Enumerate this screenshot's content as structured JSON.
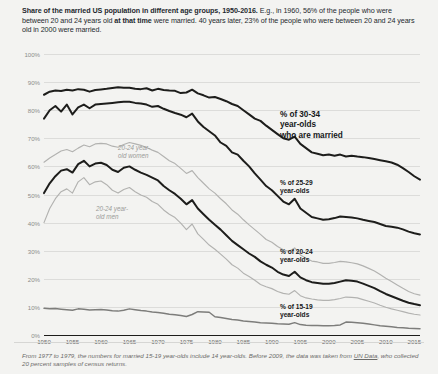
{
  "header": {
    "title_bold": "Share of the married US population in different age groups, 1950-2016.",
    "title_rest_1": " E.g., in 1960, 56% of the people who were between 20 and 24 years old ",
    "title_bold_2": "at that time",
    "title_rest_2": " were married. 40 years later, 23% of the people who were between 20 and 24 years old in 2000 were married."
  },
  "footnote": {
    "part1": "From 1977 to 1979, the numbers for married 15-19 year-olds include 14 year-olds. Before 2009, the data was taken from ",
    "link": "UN Data",
    "part2": ", who collected 20 percent samples of census returns."
  },
  "annotations": {
    "a30_34": "% of 30-34\nyear-olds\nwho are married",
    "a25_29": "% of 25-29\nyear-olds",
    "a20_24": "% of 20-24\nyear-olds",
    "a15_19": "% of 15-19\nyear-olds",
    "women": "20-24 year-\nold women",
    "men": "20-24 year-\nold men"
  },
  "colors": {
    "dark_line": "#1d1d1b",
    "grey_line": "#b2b2b0",
    "mid_line": "#7d7d7b",
    "grid": "#dcdcda",
    "background": "#f3f3f1"
  },
  "chart_data": {
    "type": "line",
    "title": "Share of the married US population in different age groups, 1950-2016",
    "xlabel": "",
    "ylabel": "",
    "xlim": [
      1950,
      2016
    ],
    "ylim": [
      0,
      100
    ],
    "grid": true,
    "legend": "inline-annotations",
    "yticks": [
      "0%",
      "10%",
      "20%",
      "30%",
      "40%",
      "50%",
      "60%",
      "70%",
      "80%",
      "90%",
      "100%"
    ],
    "ytick_values": [
      0,
      10,
      20,
      30,
      40,
      50,
      60,
      70,
      80,
      90,
      100
    ],
    "xticks": [
      "1950",
      "1955",
      "1960",
      "1965",
      "1970",
      "1975",
      "1980",
      "1985",
      "1990",
      "1995",
      "2000",
      "2005",
      "2010",
      "2015"
    ],
    "xtick_values": [
      1950,
      1955,
      1960,
      1965,
      1970,
      1975,
      1980,
      1985,
      1990,
      1995,
      2000,
      2005,
      2010,
      2015
    ],
    "x": [
      1950,
      1951,
      1952,
      1953,
      1954,
      1955,
      1956,
      1957,
      1958,
      1959,
      1960,
      1961,
      1962,
      1963,
      1964,
      1965,
      1966,
      1967,
      1968,
      1969,
      1970,
      1971,
      1972,
      1973,
      1974,
      1975,
      1976,
      1977,
      1978,
      1979,
      1980,
      1981,
      1982,
      1983,
      1984,
      1985,
      1986,
      1987,
      1988,
      1989,
      1990,
      1991,
      1992,
      1993,
      1994,
      1995,
      1996,
      1997,
      1998,
      1999,
      2000,
      2001,
      2002,
      2003,
      2004,
      2005,
      2006,
      2007,
      2008,
      2009,
      2010,
      2011,
      2012,
      2013,
      2014,
      2015,
      2016
    ],
    "series": [
      {
        "name": "% of 30-34 year-olds who are married",
        "color": "#1d1d1b",
        "width": "thick",
        "values": [
          85.5,
          86.6,
          87.0,
          86.8,
          87.3,
          87.0,
          87.5,
          87.3,
          86.6,
          87.2,
          87.4,
          87.6,
          87.9,
          88.2,
          88.0,
          88.0,
          87.6,
          87.5,
          87.8,
          87.0,
          87.6,
          87.2,
          87.0,
          86.9,
          86.1,
          86.3,
          87.3,
          86.0,
          85.3,
          84.5,
          84.7,
          84.0,
          83.2,
          82.2,
          81.5,
          80.0,
          78.5,
          77.0,
          76.2,
          74.5,
          73.0,
          71.5,
          70.0,
          69.5,
          70.6,
          68.0,
          66.5,
          65.0,
          64.5,
          64.0,
          64.2,
          63.8,
          64.2,
          63.5,
          63.8,
          63.5,
          63.3,
          63.0,
          62.6,
          62.2,
          61.8,
          61.4,
          60.6,
          59.4,
          58.0,
          56.5,
          55.3
        ]
      },
      {
        "name": "% of 25-29 year-olds",
        "color": "#1d1d1b",
        "width": "thick",
        "values": [
          77.0,
          80.0,
          81.5,
          79.5,
          82.0,
          78.5,
          81.0,
          82.0,
          80.7,
          82.0,
          82.2,
          82.4,
          82.6,
          82.8,
          83.0,
          83.0,
          82.6,
          82.4,
          82.0,
          81.2,
          81.5,
          80.5,
          79.7,
          79.0,
          78.4,
          77.5,
          78.8,
          76.0,
          74.0,
          72.5,
          71.0,
          68.5,
          67.3,
          65.0,
          64.2,
          62.0,
          60.0,
          57.5,
          55.3,
          53.0,
          51.5,
          49.5,
          47.5,
          46.5,
          48.5,
          45.0,
          43.5,
          42.0,
          41.5,
          41.0,
          41.2,
          41.6,
          42.2,
          42.0,
          41.8,
          41.5,
          41.0,
          40.6,
          40.2,
          39.5,
          38.8,
          38.5,
          38.2,
          37.6,
          36.8,
          36.2,
          35.8
        ]
      },
      {
        "name": "20-24 year-old women",
        "color": "#b2b2b0",
        "width": "thin",
        "values": [
          61.5,
          63.0,
          64.2,
          65.5,
          66.0,
          65.2,
          66.5,
          67.6,
          67.0,
          68.0,
          68.2,
          68.0,
          67.2,
          66.8,
          67.8,
          68.5,
          68.0,
          67.5,
          66.7,
          65.8,
          65.0,
          63.5,
          62.0,
          61.0,
          59.3,
          57.5,
          58.5,
          56.0,
          54.0,
          52.0,
          50.5,
          48.5,
          46.7,
          44.5,
          43.0,
          41.0,
          39.2,
          37.5,
          35.8,
          34.0,
          33.0,
          31.5,
          30.3,
          29.8,
          31.0,
          28.5,
          27.3,
          26.3,
          26.0,
          25.5,
          25.5,
          25.8,
          26.2,
          26.0,
          25.7,
          25.3,
          24.6,
          23.7,
          22.8,
          21.5,
          20.2,
          19.0,
          17.8,
          16.6,
          15.5,
          14.7,
          14.2
        ]
      },
      {
        "name": "20-24 year-olds",
        "color": "#1d1d1b",
        "width": "thick",
        "values": [
          50.5,
          54.0,
          56.5,
          58.5,
          59.0,
          57.8,
          60.8,
          62.0,
          60.0,
          61.0,
          61.3,
          60.5,
          58.8,
          58.0,
          59.5,
          60.0,
          58.8,
          57.8,
          57.0,
          56.0,
          55.0,
          53.0,
          51.5,
          50.2,
          48.5,
          46.5,
          48.0,
          45.0,
          43.0,
          41.0,
          39.2,
          37.5,
          35.5,
          33.5,
          32.0,
          30.5,
          29.0,
          27.8,
          26.2,
          25.0,
          24.0,
          22.5,
          21.5,
          21.0,
          22.5,
          20.5,
          19.5,
          18.8,
          18.5,
          18.2,
          18.2,
          18.5,
          19.0,
          19.5,
          19.3,
          19.0,
          18.3,
          17.5,
          16.7,
          15.6,
          14.6,
          13.8,
          13.0,
          12.2,
          11.5,
          11.0,
          10.6
        ]
      },
      {
        "name": "20-24 year-old men",
        "color": "#b2b2b0",
        "width": "thin",
        "values": [
          40.0,
          45.0,
          48.5,
          51.0,
          52.0,
          50.5,
          54.5,
          56.0,
          53.5,
          54.5,
          54.8,
          53.5,
          51.5,
          50.5,
          51.8,
          52.5,
          51.0,
          49.8,
          49.0,
          47.5,
          46.5,
          44.5,
          43.0,
          41.8,
          39.8,
          37.5,
          39.5,
          36.0,
          34.0,
          32.0,
          30.5,
          28.8,
          27.0,
          25.0,
          23.8,
          22.0,
          20.8,
          19.5,
          18.0,
          17.2,
          16.5,
          15.5,
          14.8,
          14.5,
          15.8,
          14.0,
          13.2,
          12.8,
          12.5,
          12.3,
          12.3,
          12.6,
          13.0,
          13.5,
          13.4,
          13.2,
          12.6,
          12.0,
          11.4,
          10.6,
          9.9,
          9.3,
          8.8,
          8.3,
          7.8,
          7.4,
          7.1
        ]
      },
      {
        "name": "% of 15-19 year-olds",
        "color": "#7d7d7b",
        "width": "medium",
        "values": [
          9.5,
          9.3,
          9.4,
          9.2,
          9.0,
          8.8,
          9.3,
          9.2,
          8.9,
          9.0,
          9.1,
          8.9,
          8.6,
          8.5,
          8.8,
          9.3,
          9.0,
          8.7,
          8.5,
          8.2,
          8.0,
          7.7,
          7.4,
          7.2,
          6.9,
          6.6,
          7.3,
          8.3,
          8.2,
          8.1,
          6.5,
          6.2,
          5.9,
          5.5,
          5.3,
          5.0,
          4.8,
          4.6,
          4.4,
          4.3,
          4.2,
          4.0,
          3.9,
          3.8,
          4.4,
          3.7,
          3.5,
          3.4,
          3.4,
          3.3,
          3.3,
          3.4,
          3.6,
          4.6,
          4.5,
          4.4,
          4.2,
          3.9,
          3.6,
          3.3,
          3.1,
          2.9,
          2.7,
          2.6,
          2.4,
          2.3,
          2.2
        ]
      }
    ]
  }
}
